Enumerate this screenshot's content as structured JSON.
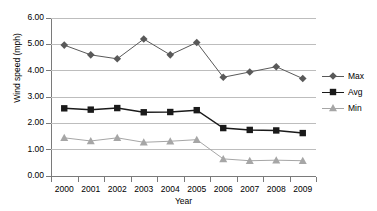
{
  "chart_data": {
    "type": "line",
    "title": "",
    "xlabel": "Year",
    "ylabel": "Wind speed (mph)",
    "categories": [
      "2000",
      "2001",
      "2002",
      "2003",
      "2004",
      "2005",
      "2006",
      "2007",
      "2008",
      "2009"
    ],
    "ylim": [
      0.0,
      6.0
    ],
    "ytick_step": 1.0,
    "ytick_labels": [
      "0.00",
      "1.00",
      "2.00",
      "3.00",
      "4.00",
      "5.00",
      "6.00"
    ],
    "grid": "horizontal",
    "legend_position": "right",
    "series": [
      {
        "name": "Max",
        "marker": "diamond",
        "color": "#595959",
        "values": [
          4.97,
          4.6,
          4.45,
          5.2,
          4.6,
          5.07,
          3.75,
          3.95,
          4.15,
          3.7
        ]
      },
      {
        "name": "Avg",
        "marker": "square",
        "color": "#1a1a1a",
        "values": [
          2.57,
          2.52,
          2.58,
          2.42,
          2.43,
          2.5,
          1.82,
          1.75,
          1.73,
          1.63
        ]
      },
      {
        "name": "Min",
        "marker": "triangle",
        "color": "#a6a6a6",
        "values": [
          1.45,
          1.33,
          1.45,
          1.28,
          1.32,
          1.38,
          0.65,
          0.58,
          0.6,
          0.58
        ]
      }
    ]
  },
  "axes": {
    "y_title": "Wind speed (mph)",
    "x_title": "Year"
  },
  "legend": {
    "items": [
      {
        "label": "Max"
      },
      {
        "label": "Avg"
      },
      {
        "label": "Min"
      }
    ]
  },
  "colors": {
    "gridline": "#bdbdbd",
    "axis": "#7a7a7a",
    "background": "#ffffff"
  }
}
